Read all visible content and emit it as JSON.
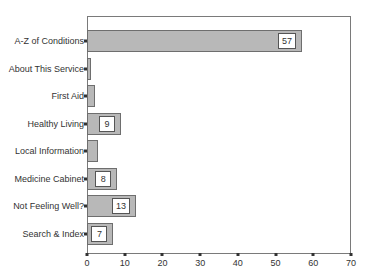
{
  "chart_data": {
    "type": "bar",
    "orientation": "horizontal",
    "title": "",
    "xlabel": "",
    "ylabel": "",
    "categories": [
      "A-Z of Conditions",
      "About This Service",
      "First Aid",
      "Healthy Living",
      "Local Information",
      "Medicine Cabinet",
      "Not Feeling Well?",
      "Search & Index"
    ],
    "category_labels_visible": [
      "A-Z of Conditions",
      "About This Service",
      "First Aid",
      "Healthy Living",
      "Local Information",
      "Medicine Cabinet",
      "Not Feeling Well?",
      "Search & Index"
    ],
    "values": [
      57,
      1,
      2,
      9,
      3,
      8,
      13,
      7
    ],
    "data_labels": [
      "57",
      "",
      "",
      "9",
      "",
      "8",
      "13",
      "7"
    ],
    "xlim": [
      0,
      70
    ],
    "xticks": [
      0,
      10,
      20,
      30,
      40,
      50,
      60,
      70
    ],
    "grid": false,
    "legend": null,
    "colors": {
      "bar_fill": "#b8b8b8",
      "bar_border": "#6e6e6e",
      "frame": "#7a7a7a"
    }
  }
}
